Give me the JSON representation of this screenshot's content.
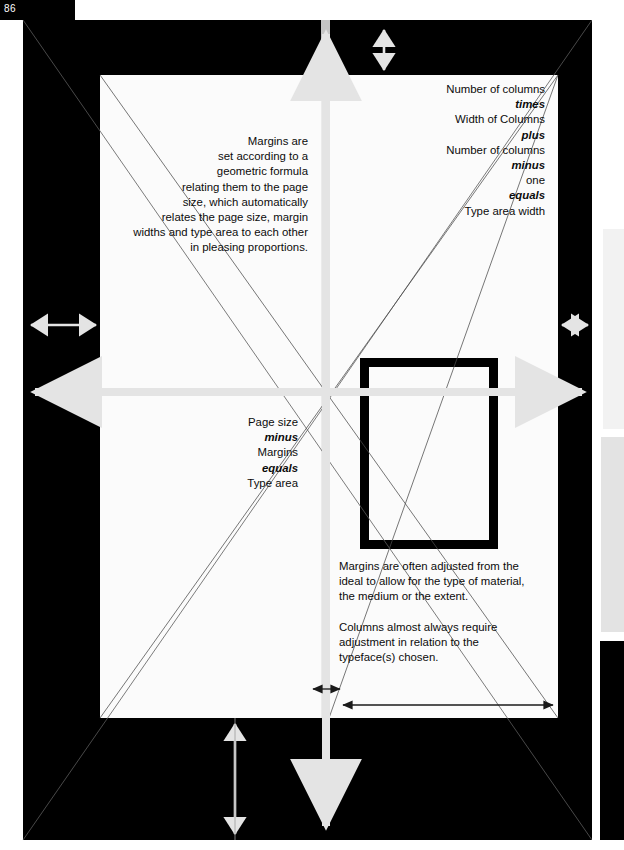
{
  "folio": {
    "number": "86"
  },
  "colors": {
    "page": "#fbfbfb",
    "spread_background": "#000000",
    "arrow_light": "#e4e4e4",
    "arrow_dark": "#1a1a1a",
    "rule": "#555555",
    "gutter": "#e8e8e8"
  },
  "text_blocks": {
    "margins_formula": {
      "align": "right",
      "lines": [
        "Margins are",
        "set according to a",
        "geometric formula",
        "relating them to the page",
        "size, which automatically",
        "relates the page size, margin",
        "widths and type area to each other",
        "in pleasing proportions."
      ]
    },
    "columns_formula": {
      "align": "right",
      "lines": [
        {
          "text": "Number of columns",
          "emphasis": false
        },
        {
          "text": "times",
          "emphasis": true
        },
        {
          "text": "Width of Columns",
          "emphasis": false
        },
        {
          "text": "plus",
          "emphasis": true
        },
        {
          "text": "Number of columns",
          "emphasis": false
        },
        {
          "text": "minus",
          "emphasis": true
        },
        {
          "text": "one",
          "emphasis": false
        },
        {
          "text": "equals",
          "emphasis": true
        },
        {
          "text": "Type area width",
          "emphasis": false
        }
      ]
    },
    "page_size_formula": {
      "align": "right",
      "lines": [
        {
          "text": "Page size",
          "emphasis": false
        },
        {
          "text": "minus",
          "emphasis": true
        },
        {
          "text": "Margins",
          "emphasis": false
        },
        {
          "text": "equals",
          "emphasis": true
        },
        {
          "text": "Type area",
          "emphasis": false
        }
      ]
    },
    "note_margins": {
      "align": "left",
      "lines": [
        "Margins are often adjusted from the",
        "ideal to allow for the type of material,",
        "the medium or the extent."
      ]
    },
    "note_columns": {
      "align": "left",
      "lines": [
        "Columns almost always require",
        "adjustment in relation to the",
        "typeface(s) chosen."
      ]
    }
  },
  "diagram": {
    "title_implied": "Page margin and type area construction diagram",
    "type_area_box": {
      "label": "type-area-rectangle"
    },
    "arrows": [
      {
        "name": "top-margin-arrow",
        "orientation": "vertical",
        "style": "double",
        "tone": "light"
      },
      {
        "name": "bottom-margin-arrow",
        "orientation": "vertical",
        "style": "double",
        "tone": "light"
      },
      {
        "name": "left-margin-arrow",
        "orientation": "horizontal",
        "style": "double",
        "tone": "light"
      },
      {
        "name": "right-margin-arrow",
        "orientation": "horizontal",
        "style": "double",
        "tone": "light"
      },
      {
        "name": "page-width-arrow",
        "orientation": "horizontal",
        "style": "double",
        "tone": "light"
      },
      {
        "name": "page-height-arrow",
        "orientation": "vertical",
        "style": "double",
        "tone": "light"
      },
      {
        "name": "type-area-width-arrow",
        "orientation": "horizontal",
        "style": "double",
        "tone": "dark"
      },
      {
        "name": "gutter-width-arrow",
        "orientation": "horizontal",
        "style": "double",
        "tone": "dark"
      }
    ]
  }
}
